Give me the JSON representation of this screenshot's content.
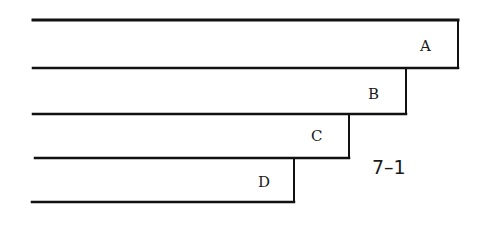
{
  "figure_label": "7–1",
  "strips": [
    {
      "label": "A",
      "top": 20,
      "bottom": 68,
      "left": 33,
      "right": 458,
      "label_x": 420,
      "label_y": 51
    },
    {
      "label": "B",
      "top": 68,
      "bottom": 114,
      "left": 33,
      "right": 406,
      "label_x": 368,
      "label_y": 99
    },
    {
      "label": "C",
      "top": 114,
      "bottom": 158,
      "left": 35,
      "right": 349,
      "label_x": 311,
      "label_y": 141
    },
    {
      "label": "D",
      "top": 158,
      "bottom": 202,
      "left": 32,
      "right": 294,
      "label_x": 258,
      "label_y": 187
    }
  ],
  "colors": {
    "line": "#111111",
    "background": "#ffffff"
  }
}
